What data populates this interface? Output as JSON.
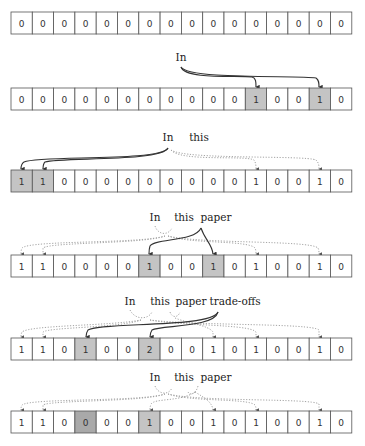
{
  "diagram": {
    "cell_count": 16,
    "colors": {
      "cell_fill": "#ffffff",
      "highlight": "#c4c4c4",
      "highlight_dark": "#a9a9a9",
      "border": "#555555",
      "solid_arrow": "#333333",
      "dotted_arrow": "#9a9a9a"
    },
    "rows": [
      {
        "id": "initial",
        "words": [],
        "values": [
          "0",
          "0",
          "0",
          "0",
          "0",
          "0",
          "0",
          "0",
          "0",
          "0",
          "0",
          "0",
          "0",
          "0",
          "0",
          "0"
        ],
        "highlight": [],
        "highlight_dark": []
      },
      {
        "id": "insert-In",
        "words": [
          "In"
        ],
        "values": [
          "0",
          "0",
          "0",
          "0",
          "0",
          "0",
          "0",
          "0",
          "0",
          "0",
          "0",
          "1",
          "0",
          "0",
          "1",
          "0"
        ],
        "highlight": [
          11,
          14
        ],
        "highlight_dark": []
      },
      {
        "id": "insert-this",
        "words": [
          "In",
          "this"
        ],
        "values": [
          "1",
          "1",
          "0",
          "0",
          "0",
          "0",
          "0",
          "0",
          "0",
          "0",
          "0",
          "1",
          "0",
          "0",
          "1",
          "0"
        ],
        "highlight": [
          0,
          1
        ],
        "highlight_dark": []
      },
      {
        "id": "insert-paper",
        "words": [
          "In",
          "this",
          "paper"
        ],
        "values": [
          "1",
          "1",
          "0",
          "0",
          "0",
          "0",
          "1",
          "0",
          "0",
          "1",
          "0",
          "1",
          "0",
          "0",
          "1",
          "0"
        ],
        "highlight": [
          6,
          9
        ],
        "highlight_dark": []
      },
      {
        "id": "insert-trade-offs",
        "words": [
          "In",
          "this",
          "paper",
          "trade-offs"
        ],
        "values": [
          "1",
          "1",
          "0",
          "1",
          "0",
          "0",
          "2",
          "0",
          "0",
          "1",
          "0",
          "1",
          "0",
          "0",
          "1",
          "0"
        ],
        "highlight": [
          3,
          6
        ],
        "highlight_dark": []
      },
      {
        "id": "delete-trade-offs",
        "words": [
          "In",
          "this",
          "paper"
        ],
        "values": [
          "1",
          "1",
          "0",
          "0",
          "0",
          "0",
          "1",
          "0",
          "0",
          "1",
          "0",
          "1",
          "0",
          "0",
          "1",
          "0"
        ],
        "highlight": [
          6
        ],
        "highlight_dark": [
          3
        ]
      }
    ]
  }
}
